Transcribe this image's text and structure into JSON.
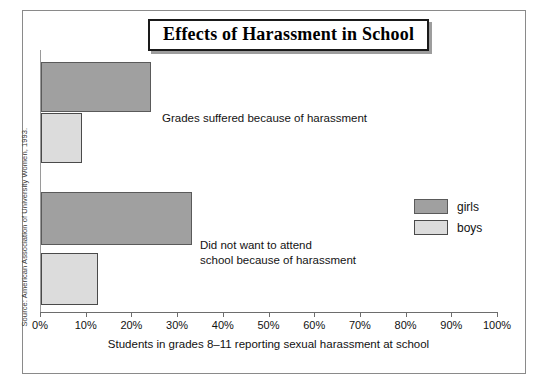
{
  "chart_data": {
    "type": "bar",
    "orientation": "horizontal",
    "title": "Effects of Harassment in School",
    "xlabel": "Students in grades 8–11 reporting sexual harassment at school",
    "ylabel": "",
    "xlim": [
      0,
      100
    ],
    "xunit": "%",
    "grid": false,
    "legend_position": "right",
    "categories": [
      "Grades suffered because of harassment",
      "Did not want to attend\nschool because of harassment"
    ],
    "series": [
      {
        "name": "girls",
        "color": "#a0a0a0",
        "values": [
          24,
          33
        ]
      },
      {
        "name": "boys",
        "color": "#dcdcdc",
        "values": [
          9,
          12.5
        ]
      }
    ],
    "xticks": [
      {
        "value": 0,
        "label": "0%"
      },
      {
        "value": 10,
        "label": "10%"
      },
      {
        "value": 20,
        "label": "20%"
      },
      {
        "value": 30,
        "label": "30%"
      },
      {
        "value": 40,
        "label": "40%"
      },
      {
        "value": 50,
        "label": "50%"
      },
      {
        "value": 60,
        "label": "60%"
      },
      {
        "value": 70,
        "label": "70%"
      },
      {
        "value": 80,
        "label": "80%"
      },
      {
        "value": 90,
        "label": "90%"
      },
      {
        "value": 100,
        "label": "100%"
      }
    ],
    "annotations": {
      "source": "Source: American Association of University Women, 1993."
    }
  },
  "figure": {
    "title": "Effects of Harassment in School",
    "x_axis_title": "Students in grades 8–11 reporting sexual harassment at school",
    "source": "Source: American Association of University Women, 1993.",
    "label_group_1": "Grades suffered because of harassment",
    "label_group_2": "Did not want to attend\nschool because of harassment",
    "legend": {
      "girls": "girls",
      "boys": "boys"
    }
  }
}
